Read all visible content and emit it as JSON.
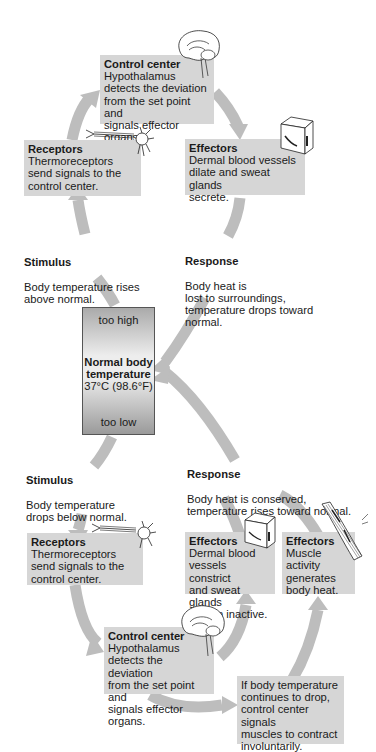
{
  "colors": {
    "box_fill": "#d6d6d6",
    "arrow_fill": "#bdbdbd",
    "thermo_border": "#555555"
  },
  "thermometer": {
    "top_label": "too high",
    "center_title": "Normal body\ntemperature",
    "center_value": "37°C (98.6°F)",
    "bottom_label": "too low"
  },
  "upper_loop": {
    "control_center": {
      "title": "Control center",
      "body": "Hypothalamus\ndetects the deviation\nfrom the set point and\nsignals effector organs.",
      "icon": "brain-icon"
    },
    "receptors": {
      "title": "Receptors",
      "body": "Thermoreceptors\nsend signals to the\ncontrol center.",
      "icon": "neuron-icon"
    },
    "effectors": {
      "title": "Effectors",
      "body": "Dermal blood vessels\ndilate and sweat glands\nsecrete.",
      "icon": "skin-block-icon"
    },
    "stimulus": {
      "title": "Stimulus",
      "body": "Body temperature rises\nabove normal."
    },
    "response": {
      "title": "Response",
      "body": "Body heat is\nlost to surroundings,\ntemperature drops toward\nnormal."
    }
  },
  "lower_loop": {
    "stimulus": {
      "title": "Stimulus",
      "body": "Body temperature\ndrops below normal."
    },
    "response": {
      "title": "Response",
      "body": "Body heat is conserved,\ntemperature rises toward normal."
    },
    "receptors": {
      "title": "Receptors",
      "body": "Thermoreceptors\nsend signals to the\ncontrol center.",
      "icon": "neuron-icon"
    },
    "effectors_skin": {
      "title": "Effectors",
      "body": "Dermal blood\nvessels constrict\nand sweat glands\nremain inactive.",
      "icon": "skin-block-icon"
    },
    "effectors_muscle": {
      "title": "Effectors",
      "body": "Muscle\nactivity\ngenerates\nbody heat.",
      "icon": "muscle-fiber-icon"
    },
    "control_center": {
      "title": "Control center",
      "body": "Hypothalamus\ndetects the deviation\nfrom the set point and\nsignals effector organs.",
      "icon": "brain-icon"
    },
    "shivering_note": {
      "body": "If body temperature\ncontinues to drop,\ncontrol center signals\nmuscles to contract\ninvoluntarily."
    }
  }
}
